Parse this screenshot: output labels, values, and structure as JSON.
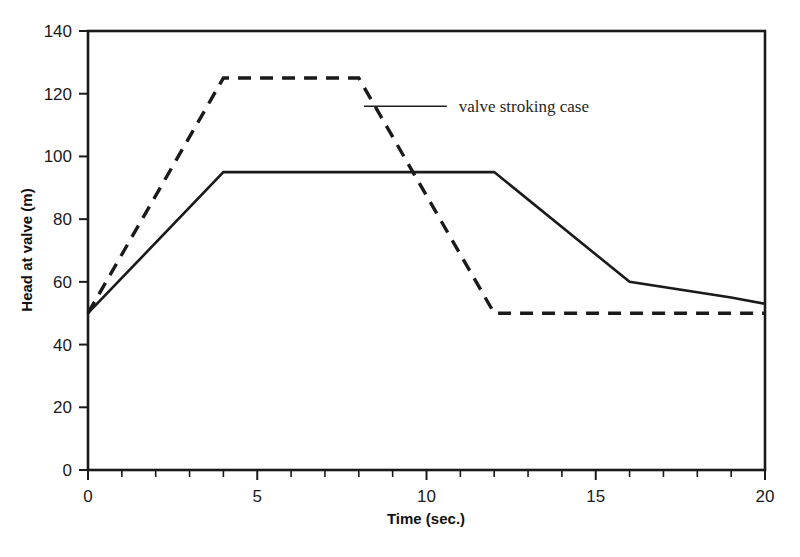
{
  "chart_data": {
    "type": "line",
    "title": "",
    "xlabel": "Time (sec.)",
    "ylabel": "Head at valve (m)",
    "xlim": [
      0,
      20
    ],
    "ylim": [
      0,
      140
    ],
    "xticks": [
      0,
      5,
      10,
      15,
      20
    ],
    "xtick_labels": [
      "0",
      "5",
      "10",
      "15",
      "20"
    ],
    "xminor_step": 1,
    "yticks": [
      0,
      20,
      40,
      60,
      80,
      100,
      120,
      140
    ],
    "ytick_labels": [
      "0",
      "20",
      "40",
      "60",
      "80",
      "100",
      "120",
      "140"
    ],
    "grid": false,
    "legend": "none",
    "frame": "box",
    "series": [
      {
        "name": "valve stroking case",
        "style": "dashed",
        "color": "#1a1a1a",
        "x": [
          0,
          4,
          8,
          12,
          20
        ],
        "y": [
          50,
          125,
          125,
          50,
          50
        ]
      },
      {
        "name": "solid case",
        "style": "solid",
        "color": "#1a1a1a",
        "x": [
          0,
          4,
          12,
          16,
          19,
          20
        ],
        "y": [
          50,
          95,
          95,
          60,
          55,
          53
        ]
      }
    ],
    "annotations": [
      {
        "text": "valve stroking case",
        "target_x": 8.15,
        "target_y": 116,
        "leader_to_x": 10.6,
        "leader_to_y": 116,
        "text_x": 10.95,
        "text_y": 116
      }
    ]
  },
  "axis": {
    "xlabel": "Time (sec.)",
    "ylabel": "Head at valve (m)"
  },
  "annotation": {
    "label": "valve stroking case"
  },
  "colors": {
    "line": "#1a1a1a",
    "frame": "#1a1a1a",
    "text": "#1a1a1a",
    "background": "#ffffff"
  }
}
